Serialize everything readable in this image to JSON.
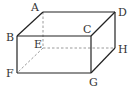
{
  "diagram": {
    "type": "cuboid",
    "colors": {
      "edge": "#222222",
      "hidden_edge": "#9a9a9a",
      "label": "#333333",
      "background": "#ffffff"
    },
    "vertices": {
      "A": {
        "label": "A",
        "x": 43,
        "y": 12
      },
      "B": {
        "label": "B",
        "x": 17,
        "y": 36
      },
      "C": {
        "label": "C",
        "x": 91,
        "y": 36
      },
      "D": {
        "label": "D",
        "x": 115,
        "y": 12
      },
      "E": {
        "label": "E",
        "x": 43,
        "y": 48
      },
      "F": {
        "label": "F",
        "x": 17,
        "y": 73
      },
      "G": {
        "label": "G",
        "x": 91,
        "y": 73
      },
      "H": {
        "label": "H",
        "x": 115,
        "y": 48
      }
    },
    "visible_edges": [
      "AB",
      "AD",
      "BC",
      "CD",
      "BF",
      "CG",
      "FG",
      "DH",
      "GH"
    ],
    "hidden_edges": [
      "AE",
      "EF",
      "EH"
    ]
  }
}
